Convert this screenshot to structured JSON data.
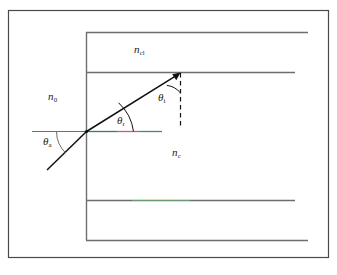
{
  "figure": {
    "type": "ray-optics-diagram",
    "colors": {
      "frame": "#4a4a4a",
      "structure_line": "#6e6e6e",
      "ray": "#111111",
      "normal_dashed": "#111111",
      "axis_left": "#6e6e6e",
      "axis_teal": "#2f7f6f",
      "axis_red": "#e0536b",
      "axis_green": "#6fbf73",
      "label": "#1a1a1a",
      "background": "#ffffff"
    },
    "labels": {
      "cladding_upper": {
        "symbol": "n",
        "sub": "cl",
        "name": "cladding-refractive-index"
      },
      "external_medium": {
        "symbol": "n",
        "sub": "0",
        "name": "external-medium-refractive-index"
      },
      "core": {
        "symbol": "n",
        "sub": "c",
        "name": "core-refractive-index"
      },
      "acceptance_angle": {
        "symbol": "θ",
        "sub": "a",
        "name": "acceptance-angle"
      },
      "refraction_angle": {
        "symbol": "θ",
        "sub": "r",
        "name": "refraction-angle"
      },
      "incidence_angle": {
        "symbol": "θ",
        "sub": "i",
        "name": "internal-incidence-angle"
      }
    },
    "geometry": {
      "outer_frame": {
        "x": 8,
        "y": 10,
        "width": 321,
        "height": 248
      },
      "fiber_left_edge_x": 86,
      "lines_right_x": 308,
      "cladding_top_y": 32,
      "core_top_y": 72,
      "core_bottom_y": 200,
      "cladding_bottom_y": 240,
      "axis_y": 131,
      "axis_left_start_x": 32,
      "axis_right_end_x": 162,
      "ray_entry_point": {
        "x": 86,
        "y": 131
      },
      "ray_start_point": {
        "x": 47,
        "y": 170
      },
      "ray_tip_point": {
        "x": 180,
        "y": 72
      },
      "normal_dashed": {
        "x": 180,
        "y_top": 72,
        "y_bottom": 128
      }
    }
  }
}
